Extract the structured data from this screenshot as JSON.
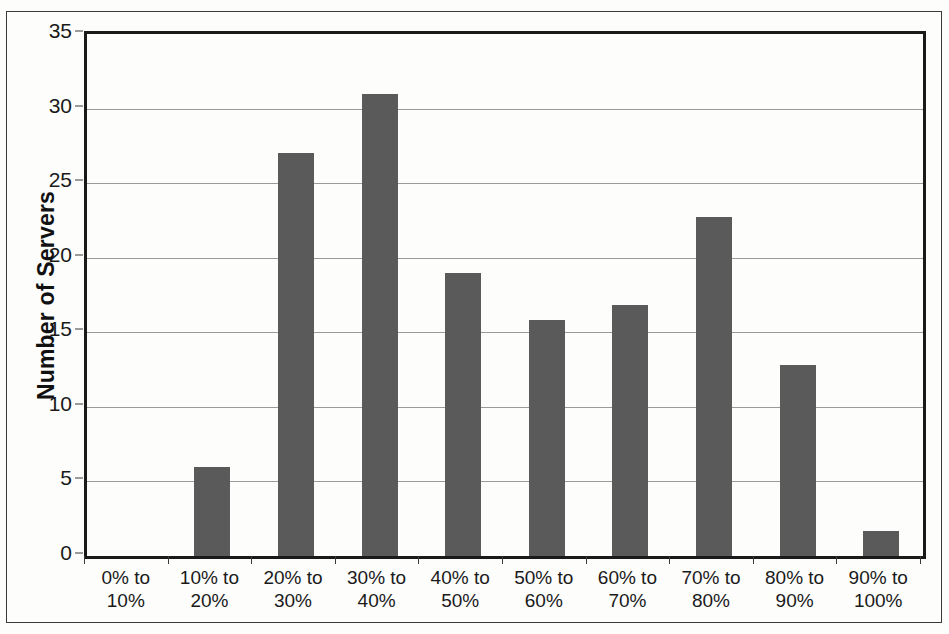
{
  "chart_data": {
    "type": "bar",
    "title": "",
    "xlabel": "",
    "ylabel": "Number of Servers",
    "ylim": [
      0,
      35
    ],
    "ytick_step": 5,
    "yticks": [
      0,
      5,
      10,
      15,
      20,
      25,
      30,
      35
    ],
    "grid": true,
    "legend": "none",
    "bar_color": "#5a5a5a",
    "axis_color": "#1a1a1a",
    "gridline_color": "#9a9a9a",
    "categories": [
      "0% to 10%",
      "10% to 20%",
      "20% to 30%",
      "30% to 40%",
      "40% to 50%",
      "50% to 60%",
      "60% to 70%",
      "70% to 80%",
      "80% to 90%",
      "90% to 100%"
    ],
    "category_lines": [
      [
        "0% to",
        "10%"
      ],
      [
        "10% to",
        "20%"
      ],
      [
        "20% to",
        "30%"
      ],
      [
        "30% to",
        "40%"
      ],
      [
        "40% to",
        "50%"
      ],
      [
        "50% to",
        "60%"
      ],
      [
        "60% to",
        "70%"
      ],
      [
        "70% to",
        "80%"
      ],
      [
        "80% to",
        "90%"
      ],
      [
        "90% to",
        "100%"
      ]
    ],
    "values": [
      0,
      6,
      27,
      31,
      19,
      15.8,
      16.8,
      22.7,
      12.8,
      1.7
    ]
  }
}
